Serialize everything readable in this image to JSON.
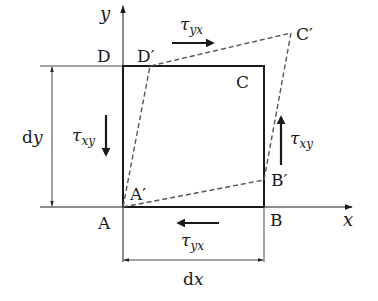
{
  "diagram": {
    "axes": {
      "x_label": "x",
      "y_label": "y"
    },
    "points": {
      "A": "A",
      "B": "B",
      "C": "C",
      "D": "D",
      "A_prime": "A′",
      "B_prime": "B′",
      "C_prime": "C′",
      "D_prime": "D′"
    },
    "stresses": {
      "tau_yx_top": {
        "symbol": "τ",
        "sub": "yx",
        "direction": "right"
      },
      "tau_yx_bottom": {
        "symbol": "τ",
        "sub": "yx",
        "direction": "left"
      },
      "tau_xy_left": {
        "symbol": "τ",
        "sub": "xy",
        "direction": "down"
      },
      "tau_xy_right": {
        "symbol": "τ",
        "sub": "xy",
        "direction": "up"
      }
    },
    "dimensions": {
      "dx": {
        "prefix": "d",
        "var": "x"
      },
      "dy": {
        "prefix": "d",
        "var": "y"
      }
    },
    "colors": {
      "solid": "#1a1a1a",
      "dashed": "#555555"
    }
  }
}
